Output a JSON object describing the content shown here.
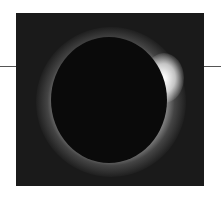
{
  "image": {
    "subject": "total solar eclipse",
    "description": "Black moon disk surrounded by bright white corona on dark background",
    "colors": {
      "background": "#1a1a1a",
      "moon": "#0a0a0a",
      "corona": "#ffffff",
      "rule": "#555555"
    }
  }
}
